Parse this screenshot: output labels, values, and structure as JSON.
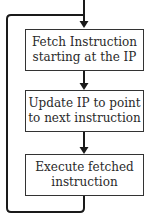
{
  "diagram": {
    "type": "flowchart-loop",
    "colors": {
      "line": "#1a1a1a",
      "box_border": "#333333",
      "text": "#2a2a2a",
      "background": "#ffffff"
    },
    "steps": [
      {
        "id": "fetch",
        "line1": "Fetch Instruction",
        "line2": "starting at the IP"
      },
      {
        "id": "update",
        "line1": "Update IP to point",
        "line2": "to next instruction"
      },
      {
        "id": "execute",
        "line1": "Execute fetched",
        "line2": "instruction"
      }
    ],
    "edges": [
      {
        "from": "entry",
        "to": "fetch"
      },
      {
        "from": "fetch",
        "to": "update"
      },
      {
        "from": "update",
        "to": "execute"
      },
      {
        "from": "execute",
        "to": "fetch",
        "kind": "loop-back"
      }
    ]
  }
}
